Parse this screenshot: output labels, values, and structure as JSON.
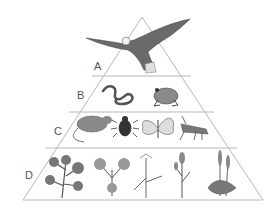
{
  "diagram": {
    "type": "ecological-pyramid",
    "colors": {
      "outline": "#b8b8b8",
      "organism_fill": "#8a8a8a",
      "organism_dark": "#3a3a3a",
      "label": "#555555"
    },
    "levels": [
      {
        "label": "A",
        "organisms": [
          "eagle"
        ]
      },
      {
        "label": "B",
        "organisms": [
          "snake",
          "frog"
        ]
      },
      {
        "label": "C",
        "organisms": [
          "rat",
          "beetle",
          "butterfly",
          "grasshopper"
        ]
      },
      {
        "label": "D",
        "organisms": [
          "leafy plant",
          "clover plant",
          "grass",
          "flowering plant",
          "plantain"
        ]
      }
    ]
  }
}
